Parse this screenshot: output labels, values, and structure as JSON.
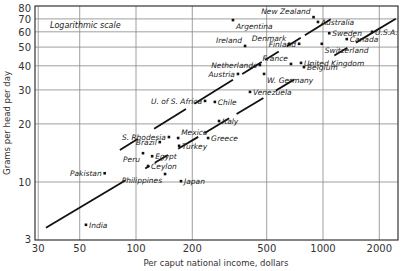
{
  "chart_data": {
    "type": "scatter",
    "title": "",
    "annotation": "Logarithmic scale",
    "xlabel": "Per caput national income, dollars",
    "ylabel": "Grams per head per day",
    "xscale": "log",
    "yscale": "log",
    "xlim": [
      30,
      2500
    ],
    "ylim": [
      5,
      80
    ],
    "xticks": [
      {
        "value": 30,
        "label": "30"
      },
      {
        "value": 50,
        "label": "50"
      },
      {
        "value": 100,
        "label": "100"
      },
      {
        "value": 200,
        "label": "200"
      },
      {
        "value": 500,
        "label": "500"
      },
      {
        "value": 1000,
        "label": "1000"
      },
      {
        "value": 2000,
        "label": "2000"
      }
    ],
    "yticks": [
      {
        "value": 5,
        "label": "3"
      },
      {
        "value": 10,
        "label": "10"
      },
      {
        "value": 20,
        "label": "20"
      },
      {
        "value": 30,
        "label": "30"
      },
      {
        "value": 40,
        "label": "40"
      },
      {
        "value": 50,
        "label": "50"
      },
      {
        "value": 60,
        "label": "60"
      },
      {
        "value": 70,
        "label": "70"
      },
      {
        "value": 80,
        "label": "80"
      }
    ],
    "grid": true,
    "points": [
      {
        "name": "New Zealand",
        "x": 890,
        "y": 71.5,
        "anchor": "left-above"
      },
      {
        "name": "Australia",
        "x": 940,
        "y": 67.5,
        "anchor": "right"
      },
      {
        "name": "Argentina",
        "x": 330,
        "y": 69,
        "anchor": "right-below"
      },
      {
        "name": "Sweden",
        "x": 1080,
        "y": 59,
        "anchor": "right"
      },
      {
        "name": "U.S.A.",
        "x": 1830,
        "y": 60,
        "anchor": "right"
      },
      {
        "name": "Canada",
        "x": 1340,
        "y": 55,
        "anchor": "right"
      },
      {
        "name": "Denmark",
        "x": 660,
        "y": 52,
        "anchor": "left-above"
      },
      {
        "name": "Finland",
        "x": 745,
        "y": 52,
        "anchor": "left"
      },
      {
        "name": "Ireland",
        "x": 383,
        "y": 50.7,
        "anchor": "left-above"
      },
      {
        "name": "Switzerland",
        "x": 985,
        "y": 52,
        "anchor": "right-below"
      },
      {
        "name": "Netherlands",
        "x": 460,
        "y": 40.4,
        "anchor": "left"
      },
      {
        "name": "Austria",
        "x": 351,
        "y": 36.3,
        "anchor": "left"
      },
      {
        "name": "France",
        "x": 674,
        "y": 40.9,
        "anchor": "left-above"
      },
      {
        "name": "United Kingdom",
        "x": 763,
        "y": 41.4,
        "anchor": "right"
      },
      {
        "name": "Belgium",
        "x": 791,
        "y": 39.4,
        "anchor": "right"
      },
      {
        "name": "W. Germany",
        "x": 484,
        "y": 36.3,
        "anchor": "right-below"
      },
      {
        "name": "Venezuela",
        "x": 407,
        "y": 29.3,
        "anchor": "right"
      },
      {
        "name": "U. of S. Africa",
        "x": 234,
        "y": 26.3,
        "anchor": "left"
      },
      {
        "name": "Chile",
        "x": 264,
        "y": 26.0,
        "anchor": "right"
      },
      {
        "name": "Italy",
        "x": 278,
        "y": 20.7,
        "anchor": "right"
      },
      {
        "name": "S. Rhodesia",
        "x": 150,
        "y": 17.1,
        "anchor": "left"
      },
      {
        "name": "Mexico",
        "x": 168,
        "y": 16.9,
        "anchor": "right-above"
      },
      {
        "name": "Greece",
        "x": 243,
        "y": 16.9,
        "anchor": "right"
      },
      {
        "name": "Brazil",
        "x": 134,
        "y": 16.1,
        "anchor": "left"
      },
      {
        "name": "Turkey",
        "x": 170,
        "y": 15.4,
        "anchor": "right"
      },
      {
        "name": "Peru",
        "x": 109,
        "y": 14.1,
        "anchor": "left-below"
      },
      {
        "name": "Egypt",
        "x": 122,
        "y": 13.6,
        "anchor": "right"
      },
      {
        "name": "Ceylon",
        "x": 116,
        "y": 12.1,
        "anchor": "right"
      },
      {
        "name": "Philippines",
        "x": 143,
        "y": 11.0,
        "anchor": "left-below"
      },
      {
        "name": "Japan",
        "x": 174,
        "y": 10.1,
        "anchor": "right"
      },
      {
        "name": "Pakistan",
        "x": 68,
        "y": 11.1,
        "anchor": "left"
      },
      {
        "name": "India",
        "x": 54,
        "y": 6.0,
        "anchor": "right"
      }
    ],
    "trend_lines": [
      {
        "name": "lower",
        "through": [
          {
            "x": 100,
            "y": 11.0
          },
          {
            "x": 1000,
            "y": 41.7
          }
        ],
        "segments": [
          [
            33,
            88
          ],
          [
            112,
            118
          ],
          [
            126,
            148
          ],
          [
            168,
            215
          ],
          [
            232,
            315
          ],
          [
            345,
            480
          ],
          [
            560,
            700
          ],
          [
            1150,
            1350
          ],
          [
            1500,
            2450
          ]
        ]
      },
      {
        "name": "upper",
        "through": [
          {
            "x": 100,
            "y": 16.5
          },
          {
            "x": 1000,
            "y": 65.9
          }
        ],
        "segments": [
          [
            82,
            102
          ],
          [
            125,
            185
          ],
          [
            205,
            330
          ],
          [
            370,
            470
          ],
          [
            490,
            580
          ],
          [
            640,
            760
          ],
          [
            800,
            1100
          ]
        ]
      }
    ]
  }
}
